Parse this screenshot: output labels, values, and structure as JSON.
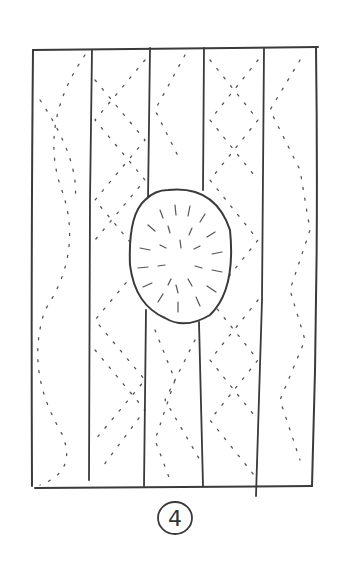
{
  "figure": {
    "label": "4",
    "stroke_color": "#3a3a3a",
    "background_color": "#ffffff",
    "panel": {
      "x": 33,
      "y": 48,
      "width": 285,
      "height": 438
    },
    "strip_dividers_x": [
      91,
      150,
      204,
      263
    ],
    "oval": {
      "cx": 177,
      "cy": 255,
      "rx": 47,
      "ry": 72
    },
    "strip_count": 5
  }
}
